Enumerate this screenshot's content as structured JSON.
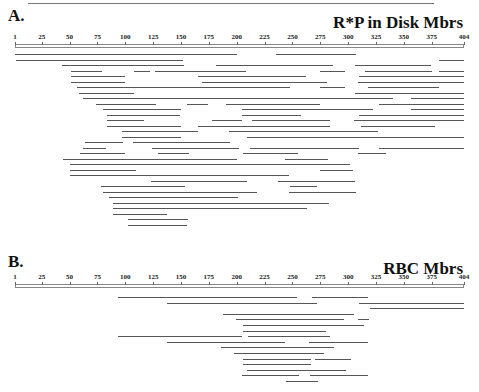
{
  "panels": {
    "a": {
      "label": "A.",
      "title": "R*P in Disk Mbrs"
    },
    "b": {
      "label": "B.",
      "title": "RBC Mbrs"
    }
  },
  "ruler": {
    "ticks": [
      "1",
      "25",
      "50",
      "75",
      "100",
      "125",
      "150",
      "175",
      "200",
      "225",
      "250",
      "275",
      "300",
      "325",
      "350",
      "375",
      "404"
    ]
  },
  "chart_data": [
    {
      "type": "table",
      "title": "R*P in Disk Mbrs",
      "panel": "A.",
      "xlabel": "Residue position",
      "xlim": [
        1,
        404
      ],
      "ticks": [
        1,
        25,
        50,
        75,
        100,
        125,
        150,
        175,
        200,
        225,
        250,
        275,
        300,
        325,
        350,
        375,
        404
      ],
      "segments": [
        {
          "row": 0,
          "start": 1,
          "end": 200
        },
        {
          "row": 0,
          "start": 235,
          "end": 307
        },
        {
          "row": 1,
          "start": 2,
          "end": 152
        },
        {
          "row": 1,
          "start": 382,
          "end": 404
        },
        {
          "row": 2,
          "start": 43,
          "end": 153
        },
        {
          "row": 2,
          "start": 181,
          "end": 286
        },
        {
          "row": 2,
          "start": 306,
          "end": 374
        },
        {
          "row": 3,
          "start": 51,
          "end": 79
        },
        {
          "row": 3,
          "start": 108,
          "end": 122
        },
        {
          "row": 3,
          "start": 127,
          "end": 208
        },
        {
          "row": 3,
          "start": 275,
          "end": 297
        },
        {
          "row": 3,
          "start": 315,
          "end": 375
        },
        {
          "row": 3,
          "start": 382,
          "end": 404
        },
        {
          "row": 4,
          "start": 51,
          "end": 100
        },
        {
          "row": 4,
          "start": 165,
          "end": 262
        },
        {
          "row": 4,
          "start": 310,
          "end": 404
        },
        {
          "row": 5,
          "start": 51,
          "end": 100
        },
        {
          "row": 5,
          "start": 169,
          "end": 281
        },
        {
          "row": 5,
          "start": 309,
          "end": 404
        },
        {
          "row": 6,
          "start": 57,
          "end": 248
        },
        {
          "row": 6,
          "start": 275,
          "end": 297
        },
        {
          "row": 6,
          "start": 318,
          "end": 382
        },
        {
          "row": 7,
          "start": 58,
          "end": 108
        },
        {
          "row": 7,
          "start": 306,
          "end": 404
        },
        {
          "row": 8,
          "start": 62,
          "end": 286
        },
        {
          "row": 8,
          "start": 238,
          "end": 340
        },
        {
          "row": 8,
          "start": 356,
          "end": 404
        },
        {
          "row": 9,
          "start": 74,
          "end": 128
        },
        {
          "row": 9,
          "start": 155,
          "end": 174
        },
        {
          "row": 9,
          "start": 190,
          "end": 275
        },
        {
          "row": 9,
          "start": 328,
          "end": 404
        },
        {
          "row": 10,
          "start": 80,
          "end": 150
        },
        {
          "row": 10,
          "start": 205,
          "end": 322
        },
        {
          "row": 10,
          "start": 356,
          "end": 404
        },
        {
          "row": 11,
          "start": 84,
          "end": 149
        },
        {
          "row": 11,
          "start": 205,
          "end": 258
        },
        {
          "row": 11,
          "start": 310,
          "end": 404
        },
        {
          "row": 12,
          "start": 84,
          "end": 117
        },
        {
          "row": 12,
          "start": 178,
          "end": 205
        },
        {
          "row": 12,
          "start": 214,
          "end": 284
        },
        {
          "row": 12,
          "start": 305,
          "end": 404
        },
        {
          "row": 13,
          "start": 84,
          "end": 150
        },
        {
          "row": 13,
          "start": 165,
          "end": 284
        },
        {
          "row": 13,
          "start": 312,
          "end": 378
        },
        {
          "row": 14,
          "start": 97,
          "end": 165
        },
        {
          "row": 14,
          "start": 193,
          "end": 327
        },
        {
          "row": 15,
          "start": 97,
          "end": 150
        },
        {
          "row": 15,
          "start": 209,
          "end": 404
        },
        {
          "row": 16,
          "start": 64,
          "end": 98
        },
        {
          "row": 16,
          "start": 107,
          "end": 194
        },
        {
          "row": 17,
          "start": 62,
          "end": 83
        },
        {
          "row": 17,
          "start": 124,
          "end": 202
        },
        {
          "row": 17,
          "start": 212,
          "end": 310
        },
        {
          "row": 17,
          "start": 328,
          "end": 404
        },
        {
          "row": 18,
          "start": 59,
          "end": 100
        },
        {
          "row": 18,
          "start": 129,
          "end": 157
        },
        {
          "row": 18,
          "start": 206,
          "end": 255
        },
        {
          "row": 18,
          "start": 309,
          "end": 334
        },
        {
          "row": 19,
          "start": 44,
          "end": 200
        },
        {
          "row": 19,
          "start": 243,
          "end": 282
        },
        {
          "row": 20,
          "start": 50,
          "end": 283
        },
        {
          "row": 20,
          "start": 274,
          "end": 302
        },
        {
          "row": 21,
          "start": 50,
          "end": 110
        },
        {
          "row": 21,
          "start": 275,
          "end": 304
        },
        {
          "row": 22,
          "start": 50,
          "end": 247
        },
        {
          "row": 23,
          "start": 123,
          "end": 209
        },
        {
          "row": 23,
          "start": 237,
          "end": 306
        },
        {
          "row": 24,
          "start": 78,
          "end": 154
        },
        {
          "row": 24,
          "start": 248,
          "end": 272
        },
        {
          "row": 25,
          "start": 80,
          "end": 218
        },
        {
          "row": 25,
          "start": 247,
          "end": 307
        },
        {
          "row": 26,
          "start": 85,
          "end": 201
        },
        {
          "row": 27,
          "start": 89,
          "end": 283
        },
        {
          "row": 28,
          "start": 89,
          "end": 263
        },
        {
          "row": 29,
          "start": 89,
          "end": 137
        },
        {
          "row": 30,
          "start": 102,
          "end": 156
        },
        {
          "row": 31,
          "start": 102,
          "end": 155
        }
      ]
    },
    {
      "type": "table",
      "title": "RBC Mbrs",
      "panel": "B.",
      "xlabel": "Residue position",
      "xlim": [
        1,
        404
      ],
      "ticks": [
        1,
        25,
        50,
        75,
        100,
        125,
        150,
        175,
        200,
        225,
        250,
        275,
        300,
        325,
        350,
        375,
        404
      ],
      "segments": [
        {
          "row": 0,
          "start": 93,
          "end": 254
        },
        {
          "row": 0,
          "start": 268,
          "end": 318
        },
        {
          "row": 1,
          "start": 137,
          "end": 272
        },
        {
          "row": 1,
          "start": 310,
          "end": 404
        },
        {
          "row": 2,
          "start": 320,
          "end": 404
        },
        {
          "row": 3,
          "start": 188,
          "end": 305
        },
        {
          "row": 4,
          "start": 199,
          "end": 296
        },
        {
          "row": 4,
          "start": 309,
          "end": 319
        },
        {
          "row": 5,
          "start": 206,
          "end": 314
        },
        {
          "row": 6,
          "start": 206,
          "end": 280
        },
        {
          "row": 7,
          "start": 93,
          "end": 205
        },
        {
          "row": 7,
          "start": 210,
          "end": 284
        },
        {
          "row": 8,
          "start": 137,
          "end": 243
        },
        {
          "row": 8,
          "start": 265,
          "end": 318
        },
        {
          "row": 9,
          "start": 186,
          "end": 287
        },
        {
          "row": 10,
          "start": 198,
          "end": 278
        },
        {
          "row": 11,
          "start": 206,
          "end": 267
        },
        {
          "row": 11,
          "start": 270,
          "end": 303
        },
        {
          "row": 12,
          "start": 206,
          "end": 267
        },
        {
          "row": 13,
          "start": 209,
          "end": 298
        },
        {
          "row": 14,
          "start": 205,
          "end": 256
        },
        {
          "row": 14,
          "start": 266,
          "end": 318
        },
        {
          "row": 15,
          "start": 244,
          "end": 273
        }
      ]
    }
  ]
}
